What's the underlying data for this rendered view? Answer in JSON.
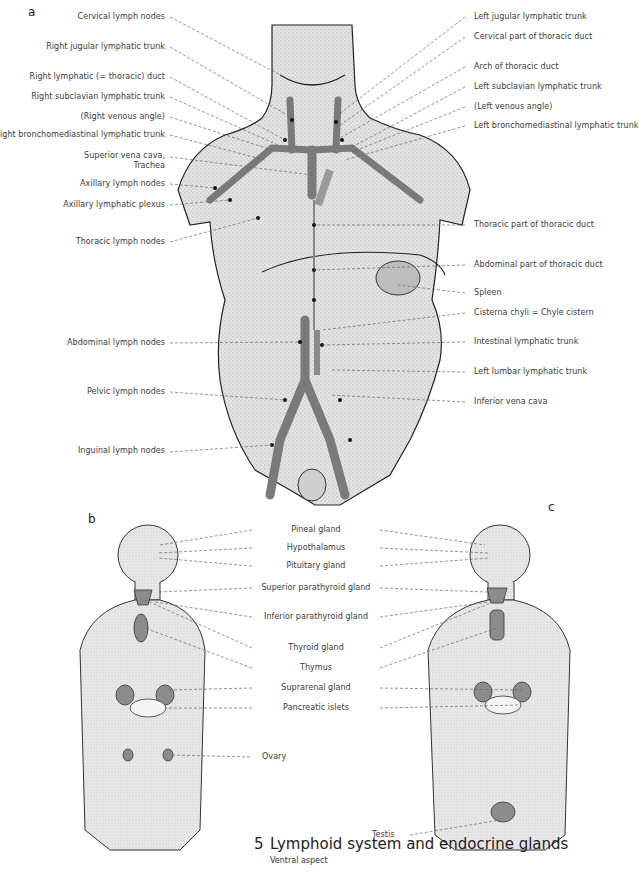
{
  "figure": {
    "number": "5",
    "title": "Lymphoid system and endocrine glands",
    "subtitle": "Ventral aspect"
  },
  "panel_a": {
    "letter": "a",
    "labels_left": [
      "Cervical lymph nodes",
      "Right jugular lymphatic trunk",
      "Right lymphatic (= thoracic) duct",
      "Right subclavian lymphatic trunk",
      "(Right venous angle)",
      "Right bronchomediastinal lymphatic trunk",
      "Superior vena cava,",
      "Trachea",
      "Axillary lymph nodes",
      "Axillary lymphatic plexus",
      "Thoracic lymph nodes",
      "Abdominal lymph nodes",
      "Pelvic lymph nodes",
      "Inguinal lymph nodes"
    ],
    "labels_right": [
      "Left jugular lymphatic trunk",
      "Cervical part of thoracic duct",
      "Arch of thoracic duct",
      "Left subclavian lymphatic trunk",
      "(Left venous angle)",
      "Left bronchomediastinal lymphatic trunk",
      "Thoracic part of thoracic duct",
      "Abdominal part of thoracic duct",
      "Spleen",
      "Cisterna chyli = Chyle cistern",
      "Intestinal lymphatic trunk",
      "Left lumbar lymphatic trunk",
      "Inferior vena cava"
    ]
  },
  "panel_b": {
    "letter": "b",
    "extra_label": "Ovary"
  },
  "panel_c": {
    "letter": "c",
    "extra_label": "Testis"
  },
  "shared_labels_bc": [
    "Pineal gland",
    "Hypothalamus",
    "Pituitary gland",
    "Superior parathyroid gland",
    "Inferior parathyroid gland",
    "Thyroid gland",
    "Thymus",
    "Suprarenal gland",
    "Pancreatic islets"
  ],
  "colors": {
    "vessel": "#7a7a7a",
    "organ": "#8c8c8c",
    "skin": "#d9d9d9",
    "leader": "#666666"
  }
}
